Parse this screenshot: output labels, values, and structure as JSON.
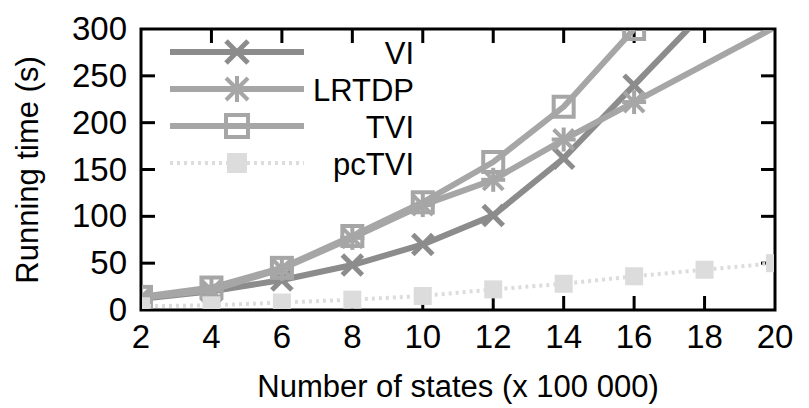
{
  "chart_data": {
    "type": "line",
    "title": "",
    "xlabel": "Number of states (x 100 000)",
    "ylabel": "Running time (s)",
    "xlim": [
      2,
      20
    ],
    "ylim": [
      0,
      300
    ],
    "xticks": [
      2,
      4,
      6,
      8,
      10,
      12,
      14,
      16,
      18,
      20
    ],
    "yticks": [
      0,
      50,
      100,
      150,
      200,
      250,
      300
    ],
    "xtick_labels": [
      "2",
      "4",
      "6",
      "8",
      "10",
      "12",
      "14",
      "16",
      "18",
      "20"
    ],
    "ytick_labels": [
      "0",
      "50",
      "100",
      "150",
      "200",
      "250",
      "300"
    ],
    "grid": false,
    "legend_position": "top-left-inside",
    "x": [
      2,
      4,
      6,
      8,
      10,
      12,
      14,
      16
    ],
    "series": [
      {
        "name": "VI",
        "marker": "x",
        "color": "#8c8c8c",
        "x": [
          2,
          4,
          6,
          8,
          10,
          12,
          14,
          16
        ],
        "values": [
          12,
          20,
          32,
          48,
          70,
          101,
          162,
          240
        ]
      },
      {
        "name": "LRTDP",
        "marker": "asterisk",
        "color": "#a6a6a6",
        "x": [
          2,
          4,
          6,
          8,
          10,
          12,
          14,
          16
        ],
        "values": [
          13,
          21,
          44,
          77,
          112,
          139,
          182,
          222
        ]
      },
      {
        "name": "TVI",
        "marker": "square",
        "color": "#a6a6a6",
        "x": [
          2,
          4,
          6,
          8,
          10,
          12,
          14,
          16
        ],
        "values": [
          14,
          24,
          45,
          79,
          115,
          158,
          217,
          300
        ]
      },
      {
        "name": "pcTVI",
        "marker": "filled-square",
        "color": "#dcdcdc",
        "x": [
          2,
          4,
          6,
          8,
          10,
          12,
          14,
          16,
          18,
          20
        ],
        "values": [
          4,
          5,
          8,
          11,
          15,
          22,
          28,
          36,
          43,
          50
        ]
      }
    ]
  },
  "legend": {
    "entries": [
      {
        "label": "VI"
      },
      {
        "label": "LRTDP"
      },
      {
        "label": "TVI"
      },
      {
        "label": "pcTVI"
      }
    ]
  }
}
